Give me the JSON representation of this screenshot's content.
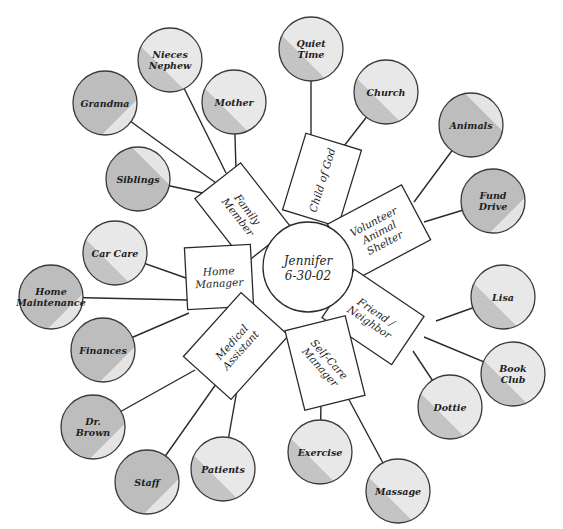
{
  "diagram": {
    "type": "mind-map",
    "center": {
      "label_line1": "Jennifer",
      "label_line2": "6-30-02",
      "x": 308,
      "y": 267,
      "r": 45
    },
    "colors": {
      "light_fill": "#e6e6e6",
      "dark_fill": "#bdbdbd",
      "stroke": "#2a2a2a",
      "box_fill": "#ffffff"
    },
    "roles": [
      {
        "id": "family-member",
        "lines": [
          "Family",
          "Member"
        ],
        "x": 243,
        "y": 213,
        "w": 82,
        "h": 58,
        "rot": 52
      },
      {
        "id": "child-of-god",
        "lines": [
          "Child of God"
        ],
        "x": 322,
        "y": 180,
        "w": 80,
        "h": 58,
        "rot": -73
      },
      {
        "id": "volunteer-animal-shelter",
        "lines": [
          "Volunteer",
          "Animal",
          "Shelter"
        ],
        "x": 379,
        "y": 232,
        "w": 84,
        "h": 62,
        "rot": -28
      },
      {
        "id": "home-manager",
        "lines": [
          "Home",
          "Manager"
        ],
        "x": 219,
        "y": 277,
        "w": 66,
        "h": 62,
        "rot": -3
      },
      {
        "id": "friend-neighbor",
        "lines": [
          "Friend /",
          "Neighbor"
        ],
        "x": 373,
        "y": 317,
        "w": 84,
        "h": 58,
        "rot": 34
      },
      {
        "id": "medical-assistant",
        "lines": [
          "Medical",
          "Assistant"
        ],
        "x": 236,
        "y": 346,
        "w": 86,
        "h": 64,
        "rot": -48
      },
      {
        "id": "self-care-manager",
        "lines": [
          "Self-Care",
          "Manager"
        ],
        "x": 325,
        "y": 363,
        "w": 62,
        "h": 82,
        "rot": -14,
        "text_rot": 62
      }
    ],
    "items": [
      {
        "id": "nieces-nephew",
        "lines": [
          "Nieces",
          "Nephew"
        ],
        "x": 170,
        "y": 60,
        "shade": "light",
        "role": "family-member",
        "attach": [
          226,
          173
        ]
      },
      {
        "id": "grandma",
        "lines": [
          "Grandma"
        ],
        "x": 105,
        "y": 103,
        "shade": "dark",
        "role": "family-member",
        "attach": [
          216,
          183
        ]
      },
      {
        "id": "mother",
        "lines": [
          "Mother"
        ],
        "x": 234,
        "y": 102,
        "shade": "light",
        "role": "family-member",
        "attach": [
          236,
          170
        ]
      },
      {
        "id": "siblings",
        "lines": [
          "Siblings"
        ],
        "x": 138,
        "y": 179,
        "shade": "dark",
        "role": "family-member",
        "attach": [
          207,
          194
        ]
      },
      {
        "id": "quiet-time",
        "lines": [
          "Quiet",
          "Time"
        ],
        "x": 311,
        "y": 49,
        "shade": "light",
        "role": "child-of-god",
        "attach": [
          311,
          139
        ]
      },
      {
        "id": "church",
        "lines": [
          "Church"
        ],
        "x": 386,
        "y": 92,
        "shade": "light",
        "role": "child-of-god",
        "attach": [
          344,
          146
        ]
      },
      {
        "id": "animals",
        "lines": [
          "Animals"
        ],
        "x": 471,
        "y": 125,
        "shade": "dark",
        "role": "volunteer-animal-shelter",
        "attach": [
          414,
          202
        ]
      },
      {
        "id": "fund-drive",
        "lines": [
          "Fund",
          "Drive"
        ],
        "x": 493,
        "y": 201,
        "shade": "dark",
        "role": "volunteer-animal-shelter",
        "attach": [
          424,
          222
        ]
      },
      {
        "id": "car-care",
        "lines": [
          "Car Care"
        ],
        "x": 115,
        "y": 253,
        "shade": "light",
        "role": "home-manager",
        "attach": [
          186,
          278
        ]
      },
      {
        "id": "home-maintenance",
        "lines": [
          "Home",
          "Maintenance"
        ],
        "x": 51,
        "y": 297,
        "shade": "dark",
        "role": "home-manager",
        "attach": [
          188,
          300
        ]
      },
      {
        "id": "finances",
        "lines": [
          "Finances"
        ],
        "x": 103,
        "y": 350,
        "shade": "dark",
        "role": "home-manager",
        "attach": [
          189,
          313
        ]
      },
      {
        "id": "lisa",
        "lines": [
          "Lisa"
        ],
        "x": 503,
        "y": 297,
        "shade": "light",
        "role": "friend-neighbor",
        "attach": [
          436,
          321
        ]
      },
      {
        "id": "book-club",
        "lines": [
          "Book",
          "Club"
        ],
        "x": 513,
        "y": 374,
        "shade": "light",
        "role": "friend-neighbor",
        "attach": [
          424,
          337
        ]
      },
      {
        "id": "dottie",
        "lines": [
          "Dottie"
        ],
        "x": 450,
        "y": 407,
        "shade": "light",
        "role": "friend-neighbor",
        "attach": [
          413,
          351
        ]
      },
      {
        "id": "dr-brown",
        "lines": [
          "Dr.",
          "Brown"
        ],
        "x": 93,
        "y": 427,
        "shade": "dark",
        "role": "medical-assistant",
        "attach": [
          195,
          370
        ]
      },
      {
        "id": "staff",
        "lines": [
          "Staff"
        ],
        "x": 147,
        "y": 482,
        "shade": "dark",
        "role": "medical-assistant",
        "attach": [
          221,
          377
        ]
      },
      {
        "id": "patients",
        "lines": [
          "Patients"
        ],
        "x": 223,
        "y": 469,
        "shade": "light",
        "role": "medical-assistant",
        "attach": [
          237,
          390
        ]
      },
      {
        "id": "exercise",
        "lines": [
          "Exercise"
        ],
        "x": 320,
        "y": 452,
        "shade": "light",
        "role": "self-care-manager",
        "attach": [
          321,
          404
        ]
      },
      {
        "id": "massage",
        "lines": [
          "Massage"
        ],
        "x": 398,
        "y": 491,
        "shade": "light",
        "role": "self-care-manager",
        "attach": [
          347,
          396
        ]
      }
    ],
    "item_radius": 32
  }
}
